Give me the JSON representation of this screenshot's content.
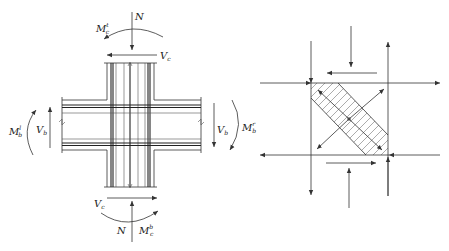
{
  "figure": {
    "left_panel": {
      "title": "beam-column joint with internal forces",
      "labels": {
        "top_axial": "N",
        "top_moment": "M",
        "top_moment_sup": "t",
        "top_moment_sub": "c",
        "top_shear": "V",
        "top_shear_sub": "c",
        "left_moment": "M",
        "left_moment_sup": "l",
        "left_moment_sub": "b",
        "left_shear": "V",
        "left_shear_sub": "b",
        "right_shear": "V",
        "right_shear_sub": "b",
        "right_moment": "M",
        "right_moment_sup": "r",
        "right_moment_sub": "b",
        "bottom_shear": "V",
        "bottom_shear_sub": "c",
        "bottom_axial": "N",
        "bottom_moment": "M",
        "bottom_moment_sup": "b",
        "bottom_moment_sub": "c"
      }
    },
    "right_panel": {
      "title": "diagonal compression strut mechanism",
      "strut": "hatched diagonal band",
      "colors": {
        "line": "#333333",
        "hatch": "#666666",
        "center_dot": "#888888"
      }
    }
  }
}
